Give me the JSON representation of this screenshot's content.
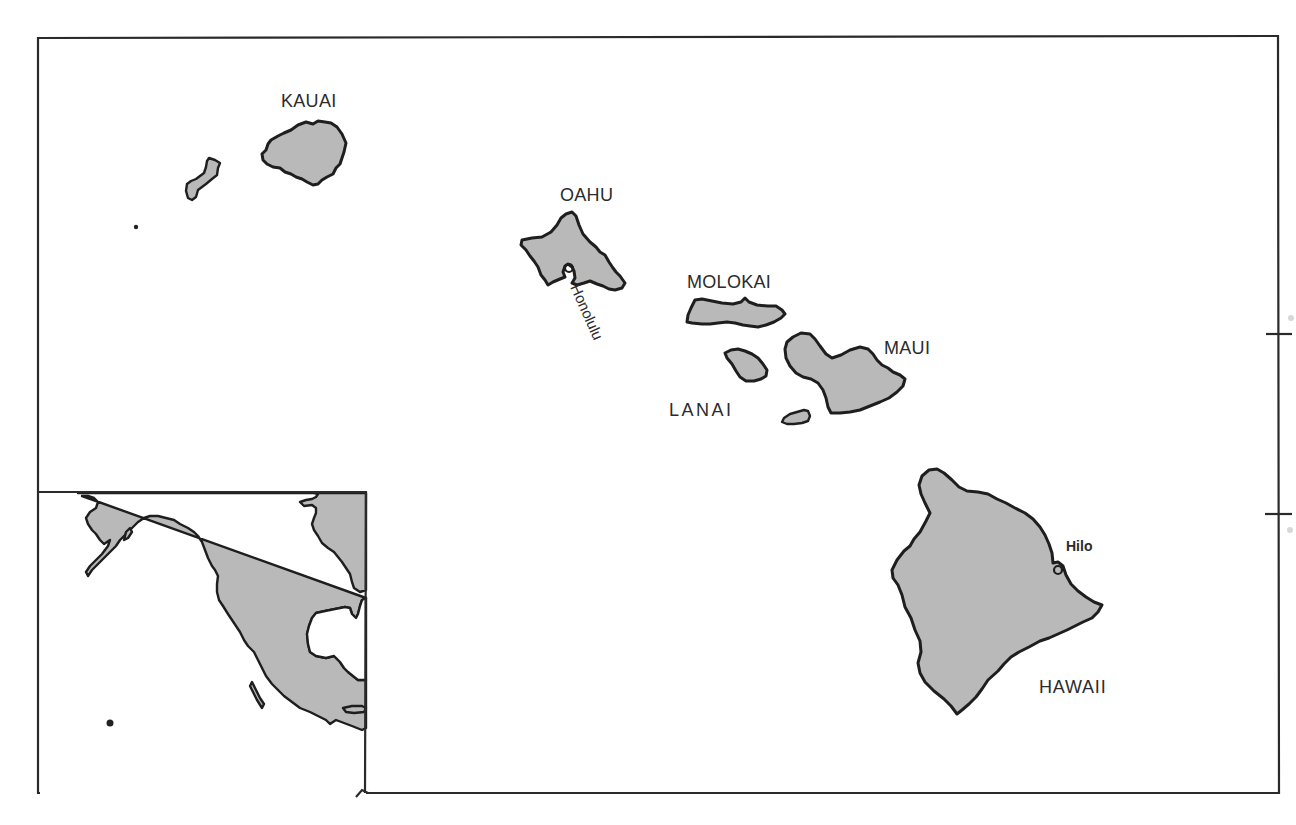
{
  "map": {
    "title": "Hawaiian Islands",
    "colors": {
      "land": "#b9b9b9",
      "outline": "#1e1e1e",
      "background": "#ffffff",
      "frame": "#2a2a2a"
    },
    "islands": [
      {
        "name": "KAUAI",
        "label": "KAUAI"
      },
      {
        "name": "NIIHAU",
        "label": ""
      },
      {
        "name": "OAHU",
        "label": "OAHU"
      },
      {
        "name": "MOLOKAI",
        "label": "MOLOKAI"
      },
      {
        "name": "LANAI",
        "label": "LANAI"
      },
      {
        "name": "MAUI",
        "label": "MAUI"
      },
      {
        "name": "KAHOOLAWE",
        "label": ""
      },
      {
        "name": "HAWAII",
        "label": "HAWAII"
      }
    ],
    "cities": [
      {
        "name": "Honolulu",
        "label": "Honolulu",
        "island": "OAHU"
      },
      {
        "name": "Hilo",
        "label": "Hilo",
        "island": "HAWAII"
      }
    ],
    "inset": {
      "description": "Locator inset: western North America and Pacific with dot marking Hawaii",
      "marker": "hawaii-location-dot"
    },
    "frame_ticks": 2
  }
}
